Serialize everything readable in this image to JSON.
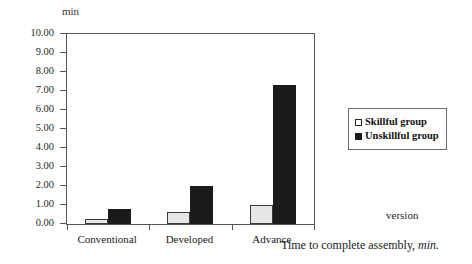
{
  "chart_data": {
    "type": "bar",
    "title": "",
    "categories": [
      "Conventional",
      "Developed",
      "Advance"
    ],
    "series": [
      {
        "name": "Skillful group",
        "values": [
          0.25,
          0.65,
          1.0
        ],
        "color": "#e6e6e6"
      },
      {
        "name": "Unskillful group",
        "values": [
          0.8,
          2.0,
          7.3
        ],
        "color": "#1b1b1b"
      }
    ],
    "xlabel": "version",
    "ylabel": "min",
    "ylim": [
      0.0,
      10.0
    ],
    "ytick_step": 1.0,
    "ytick_labels": [
      "10.00",
      "9.00",
      "8.00",
      "7.00",
      "6.00",
      "5.00",
      "4.00",
      "3.00",
      "2.00",
      "1.00",
      "0.00"
    ],
    "ytick_values": [
      10,
      9,
      8,
      7,
      6,
      5,
      4,
      3,
      2,
      1,
      0
    ],
    "grid": false,
    "legend_position": "right",
    "legend_entries": [
      "Skillful group",
      "Unskillful group"
    ]
  },
  "axis": {
    "unit_label": "min",
    "x_axis_name": "version"
  },
  "legend": {
    "items": [
      {
        "label": "Skillful group",
        "swatch": "skillful"
      },
      {
        "label": "Unskillful group",
        "swatch": "unskillful"
      }
    ]
  },
  "caption": {
    "main_text": "Time to complete assembly, ",
    "italic_text": "min."
  }
}
